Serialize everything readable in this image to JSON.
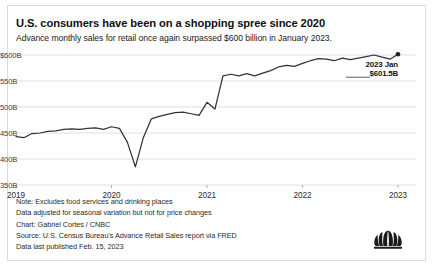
{
  "header": {
    "title": "U.S. consumers have been on a shopping spree since 2020",
    "subtitle": "Advance monthly sales for retail once again surpassed $600 billion in January 2023."
  },
  "annotation": {
    "line1": "2023 Jan",
    "line2": "$601.5B"
  },
  "footnotes": {
    "note": "Note: Excludes food services and drinking places",
    "adjustment": "Data adjusted for seasonal variation but not for price changes",
    "chart_credit": "Chart: Gabriel Cortes / CNBC",
    "source": "Source: U.S. Census Bureau's Advance Retail Sales report via FRED",
    "published": "Data last published Feb. 15, 2023"
  },
  "branding": {
    "logo_name": "cnbc-peacock-logo"
  },
  "colors": {
    "line": "#333333",
    "grid": "#d8d8d8",
    "text": "#111111",
    "frame": "#dcdcdc",
    "background": "#ffffff"
  },
  "chart_data": {
    "type": "line",
    "title": "U.S. consumers have been on a shopping spree since 2020",
    "subtitle": "Advance monthly sales for retail once again surpassed $600 billion in January 2023.",
    "xlabel": "",
    "ylabel": "",
    "grid": true,
    "legend": false,
    "ylim": [
      350,
      600
    ],
    "ytick_labels": [
      "$600B",
      "550B",
      "500B",
      "450B",
      "400B",
      "350B"
    ],
    "ytick_values": [
      600,
      550,
      500,
      450,
      400,
      350
    ],
    "xtick_labels": [
      "2019",
      "2020",
      "2021",
      "2022",
      "2023"
    ],
    "xtick_values": [
      "2019-01",
      "2020-01",
      "2021-01",
      "2022-01",
      "2023-01"
    ],
    "xlim": [
      "2019-01",
      "2023-01"
    ],
    "units": "billions of USD",
    "end_marker": {
      "x": "2023-01",
      "y": 601.5,
      "label": "2023 Jan $601.5B"
    },
    "series": [
      {
        "name": "Advance monthly retail sales",
        "x": [
          "2019-01",
          "2019-02",
          "2019-03",
          "2019-04",
          "2019-05",
          "2019-06",
          "2019-07",
          "2019-08",
          "2019-09",
          "2019-10",
          "2019-11",
          "2019-12",
          "2020-01",
          "2020-02",
          "2020-03",
          "2020-04",
          "2020-05",
          "2020-06",
          "2020-07",
          "2020-08",
          "2020-09",
          "2020-10",
          "2020-11",
          "2020-12",
          "2021-01",
          "2021-02",
          "2021-03",
          "2021-04",
          "2021-05",
          "2021-06",
          "2021-07",
          "2021-08",
          "2021-09",
          "2021-10",
          "2021-11",
          "2021-12",
          "2022-01",
          "2022-02",
          "2022-03",
          "2022-04",
          "2022-05",
          "2022-06",
          "2022-07",
          "2022-08",
          "2022-09",
          "2022-10",
          "2022-11",
          "2022-12",
          "2023-01"
        ],
        "values": [
          443,
          441,
          449,
          450,
          453,
          454,
          457,
          458,
          457,
          459,
          460,
          457,
          462,
          459,
          432,
          385,
          441,
          477,
          482,
          486,
          489,
          490,
          487,
          484,
          509,
          496,
          560,
          563,
          560,
          564,
          560,
          565,
          570,
          577,
          580,
          578,
          584,
          589,
          593,
          592,
          589,
          594,
          591,
          594,
          597,
          600,
          596,
          592,
          601.5
        ]
      }
    ],
    "annotations": [
      {
        "text": "2023 Jan $601.5B",
        "x": "2023-01",
        "y": 601.5,
        "position": "right"
      }
    ]
  }
}
